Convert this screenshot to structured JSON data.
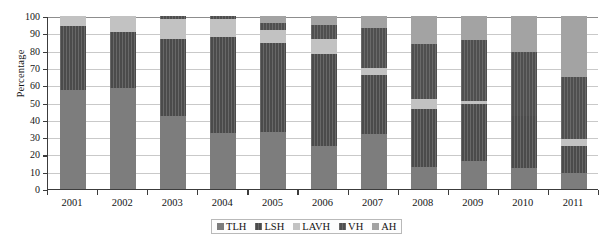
{
  "chart_data": {
    "type": "bar",
    "stacked": true,
    "title": "",
    "subtitle": "",
    "xlabel": "",
    "ylabel": "Percentage",
    "ylim": [
      0,
      100
    ],
    "ytick_labels": [
      "100",
      "90",
      "80",
      "70",
      "60",
      "50",
      "40",
      "30",
      "20",
      "10",
      "0"
    ],
    "ytick_values": [
      100,
      90,
      80,
      70,
      60,
      50,
      40,
      30,
      20,
      10,
      0
    ],
    "grid": true,
    "legend_position": "bottom-center",
    "categories": [
      "2001",
      "2002",
      "2003",
      "2004",
      "2005",
      "2006",
      "2007",
      "2008",
      "2009",
      "2010",
      "2011"
    ],
    "series": [
      {
        "name": "TLH",
        "color": "#7d7d7d",
        "values": [
          57,
          58.5,
          42,
          32.5,
          33,
          25,
          32,
          13,
          16,
          12,
          9
        ]
      },
      {
        "name": "LSH",
        "color": "#4b4b4b",
        "values": [
          37,
          32.5,
          45,
          55.5,
          51.5,
          53,
          34,
          33,
          33,
          30,
          16
        ]
      },
      {
        "name": "LAVH",
        "color": "#c2c2c2",
        "values": [
          6,
          9,
          11,
          10.5,
          7.5,
          9,
          4,
          6,
          2,
          0,
          4
        ]
      },
      {
        "name": "VH",
        "color": "#4f4f4f",
        "values": [
          0,
          0,
          2,
          1.5,
          4,
          8,
          23,
          32,
          35,
          37,
          36
        ]
      },
      {
        "name": "AH",
        "color": "#a3a3a3",
        "values": [
          0,
          0,
          0,
          0,
          4,
          5,
          7,
          16,
          14,
          21,
          35
        ]
      }
    ]
  },
  "legend": {
    "items": [
      {
        "label": "TLH"
      },
      {
        "label": "LSH"
      },
      {
        "label": "LAVH"
      },
      {
        "label": "VH"
      },
      {
        "label": "AH"
      }
    ]
  }
}
